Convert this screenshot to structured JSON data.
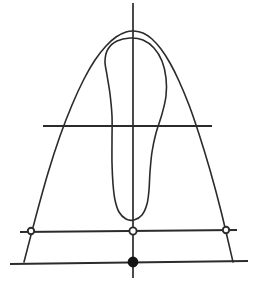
{
  "figure": {
    "title": "",
    "background_color": "#ffffff",
    "stroke_color": "#2b2b2b",
    "marker_fill_color": "#141414",
    "marker_open_fill_color": "#ffffff",
    "canvas": {
      "width": 263,
      "height": 296
    }
  },
  "chart_data": {
    "type": "line",
    "title": "",
    "subtitle": "",
    "xlabel": "",
    "ylabel": "",
    "xlim": [
      0,
      263
    ],
    "ylim": [
      296,
      0
    ],
    "grid": false,
    "legend": "none",
    "annotations": [],
    "tick_labels": {
      "x": [],
      "y": []
    },
    "series": [
      {
        "name": "outer-parabola",
        "kind": "open-curve",
        "closed": false,
        "points": [
          [
            24,
            262
          ],
          [
            36,
            216
          ],
          [
            48,
            173
          ],
          [
            60,
            136
          ],
          [
            72,
            105
          ],
          [
            84,
            79
          ],
          [
            95,
            60
          ],
          [
            106,
            46
          ],
          [
            116,
            37
          ],
          [
            126,
            32
          ],
          [
            134,
            31
          ],
          [
            143,
            33
          ],
          [
            152,
            39
          ],
          [
            161,
            49
          ],
          [
            170,
            63
          ],
          [
            179,
            81
          ],
          [
            189,
            105
          ],
          [
            199,
            134
          ],
          [
            210,
            170
          ],
          [
            221,
            211
          ],
          [
            233,
            262
          ]
        ]
      },
      {
        "name": "inner-loop",
        "kind": "closed-loop",
        "closed": true,
        "points": [
          [
            130,
            38
          ],
          [
            143,
            40
          ],
          [
            154,
            48
          ],
          [
            162,
            61
          ],
          [
            166,
            78
          ],
          [
            166,
            96
          ],
          [
            162,
            114
          ],
          [
            156,
            133
          ],
          [
            152,
            152
          ],
          [
            150,
            172
          ],
          [
            149,
            190
          ],
          [
            147,
            204
          ],
          [
            142,
            215
          ],
          [
            134,
            220
          ],
          [
            126,
            219
          ],
          [
            119,
            212
          ],
          [
            115,
            200
          ],
          [
            113,
            184
          ],
          [
            112,
            163
          ],
          [
            112,
            140
          ],
          [
            112,
            116
          ],
          [
            110,
            94
          ],
          [
            107,
            75
          ],
          [
            105,
            61
          ],
          [
            108,
            49
          ],
          [
            117,
            41
          ],
          [
            130,
            38
          ]
        ]
      },
      {
        "name": "vertical-axis",
        "kind": "line",
        "points": [
          [
            133,
            3
          ],
          [
            133,
            278
          ]
        ]
      },
      {
        "name": "mid-horizontal-chord",
        "kind": "line",
        "points": [
          [
            43,
            126
          ],
          [
            212,
            126
          ]
        ]
      },
      {
        "name": "lower-horizontal-chord",
        "kind": "line",
        "points": [
          [
            20,
            232
          ],
          [
            237,
            230
          ]
        ]
      },
      {
        "name": "base-horizontal-chord",
        "kind": "line",
        "points": [
          [
            10,
            264
          ],
          [
            248,
            261
          ]
        ]
      }
    ],
    "markers": [
      {
        "name": "left-open-marker",
        "x": 31,
        "y": 231,
        "style": "open-circle",
        "radius": 3.2
      },
      {
        "name": "center-open-marker",
        "x": 133,
        "y": 231,
        "style": "open-circle",
        "radius": 3.6
      },
      {
        "name": "right-open-marker",
        "x": 226,
        "y": 230,
        "style": "open-circle",
        "radius": 3.2
      },
      {
        "name": "center-filled-marker",
        "x": 133,
        "y": 262,
        "style": "filled-circle",
        "radius": 4.6
      }
    ]
  }
}
